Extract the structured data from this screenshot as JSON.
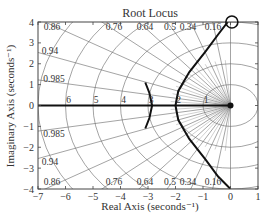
{
  "chart_data": {
    "type": "line",
    "title": "Root Locus",
    "xlabel": "Real Axis (seconds⁻¹)",
    "ylabel": "Imaginary Axis (seconds⁻¹)",
    "xlim": [
      -7,
      1
    ],
    "ylim": [
      -4,
      4
    ],
    "xticks": [
      -7,
      -6,
      -5,
      -4,
      -3,
      -2,
      -1,
      0,
      1
    ],
    "yticks": [
      -4,
      -3,
      -2,
      -1,
      0,
      1,
      2,
      3,
      4
    ],
    "grid": "s-plane (damping ratio rays + natural frequency arcs)",
    "damping_labels": [
      "0.86",
      "0.76",
      "0.64",
      "0.5",
      "0.34",
      "0.16"
    ],
    "damping_labels_left": [
      "0.94",
      "0.985"
    ],
    "frequency_labels": [
      "6",
      "5",
      "4",
      "3",
      "2",
      "1"
    ],
    "series": [
      {
        "name": "real-axis branch",
        "points": [
          [
            -7,
            0
          ],
          [
            0,
            0
          ]
        ]
      },
      {
        "name": "branch near -3 upper",
        "points": [
          [
            -3.1,
            1.1
          ],
          [
            -2.95,
            0.6
          ],
          [
            -2.85,
            0
          ]
        ]
      },
      {
        "name": "branch near -3 lower",
        "points": [
          [
            -2.85,
            0
          ],
          [
            -2.95,
            -0.6
          ],
          [
            -3.1,
            -1.1
          ]
        ]
      },
      {
        "name": "upper asymptote branch",
        "points": [
          [
            -2.0,
            0
          ],
          [
            -1.9,
            0.7
          ],
          [
            -1.5,
            1.6
          ],
          [
            -0.9,
            2.6
          ],
          [
            -0.45,
            3.4
          ],
          [
            -0.1,
            4.0
          ]
        ]
      },
      {
        "name": "lower asymptote branch",
        "points": [
          [
            -2.0,
            0
          ],
          [
            -1.9,
            -0.7
          ],
          [
            -1.5,
            -1.6
          ],
          [
            -0.9,
            -2.6
          ],
          [
            -0.45,
            -3.4
          ],
          [
            0,
            -4.0
          ]
        ]
      }
    ],
    "markers": [
      {
        "type": "pole-cluster",
        "at": [
          0,
          0
        ]
      },
      {
        "type": "circle",
        "at": [
          0.05,
          4.0
        ]
      }
    ]
  }
}
